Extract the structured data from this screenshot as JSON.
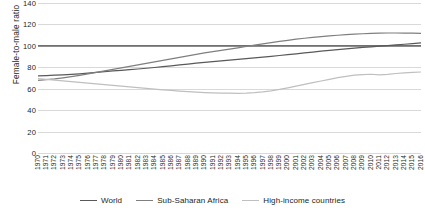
{
  "chart_data": {
    "type": "line",
    "title": "",
    "xlabel": "",
    "ylabel": "Female-to-male ratio",
    "ylim": [
      0,
      140
    ],
    "yticks": [
      0,
      20,
      40,
      60,
      80,
      100,
      120,
      140
    ],
    "grid": true,
    "legend_position": "bottom",
    "x": [
      1970,
      1971,
      1972,
      1973,
      1974,
      1975,
      1976,
      1977,
      1978,
      1979,
      1980,
      1981,
      1982,
      1983,
      1984,
      1985,
      1986,
      1987,
      1988,
      1989,
      1990,
      1991,
      1992,
      1993,
      1994,
      1995,
      1996,
      1997,
      1998,
      1999,
      2000,
      2001,
      2002,
      2003,
      2004,
      2005,
      2006,
      2007,
      2008,
      2009,
      2010,
      2011,
      2012,
      2013,
      2014,
      2015,
      2016
    ],
    "series": [
      {
        "name": "World",
        "color": "#595959",
        "values": [
          72,
          72.3,
          72.6,
          73,
          73.4,
          73.9,
          74.5,
          75.2,
          76,
          76.6,
          77.2,
          77.8,
          78.4,
          79.1,
          79.8,
          80.6,
          81.4,
          82.2,
          83,
          83.8,
          84.6,
          85.3,
          86,
          86.7,
          87.4,
          88.1,
          88.8,
          89.5,
          90.2,
          91,
          91.8,
          92.6,
          93.4,
          94.2,
          95,
          95.8,
          96.5,
          97.2,
          97.9,
          98.5,
          99.1,
          99.7,
          100.3,
          100.9,
          101.5,
          102.1,
          102.7
        ]
      },
      {
        "name": "Sub-Saharan Africa",
        "color": "#7f7f7f",
        "values": [
          67.8,
          68.4,
          69.2,
          70.2,
          71.3,
          72.5,
          73.8,
          75.2,
          76.6,
          78,
          79.4,
          80.8,
          82.2,
          83.6,
          85,
          86.4,
          87.8,
          89.2,
          90.6,
          92,
          93.4,
          94.6,
          95.8,
          97,
          98.2,
          99.4,
          100.6,
          101.8,
          103,
          104.1,
          105.2,
          106.2,
          107.1,
          107.9,
          108.6,
          109.3,
          109.9,
          110.4,
          110.9,
          111.3,
          111.6,
          111.9,
          112,
          112,
          111.9,
          111.8,
          111.7
        ]
      },
      {
        "name": "High-income countries",
        "color": "#bfbfbf",
        "values": [
          69.5,
          68.8,
          68.1,
          67.4,
          66.7,
          66,
          65.3,
          64.6,
          63.9,
          63.2,
          62.5,
          61.8,
          61.1,
          60.4,
          59.7,
          59,
          58.4,
          57.8,
          57.3,
          56.8,
          56.4,
          56.1,
          55.9,
          55.8,
          55.7,
          55.9,
          56.3,
          57,
          58,
          59.3,
          60.8,
          62.4,
          64,
          65.6,
          67.2,
          68.8,
          70.3,
          71.6,
          72.6,
          73.2,
          73.5,
          73,
          73.3,
          74.2,
          74.8,
          75.2,
          75.6
        ]
      }
    ],
    "reference_line": {
      "value": 100,
      "color": "#404040"
    }
  },
  "legend": {
    "items": [
      {
        "label": "World"
      },
      {
        "label": "Sub-Saharan Africa"
      },
      {
        "label": "High-income countries"
      }
    ]
  }
}
